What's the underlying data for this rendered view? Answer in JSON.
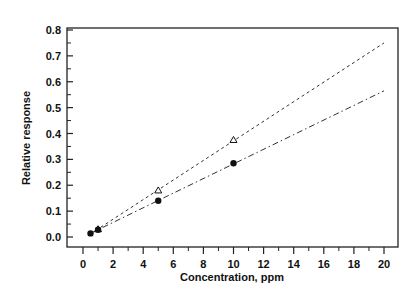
{
  "chart_data": {
    "type": "scatter",
    "title": "",
    "xlabel": "Concentration, ppm",
    "ylabel": "Relative response",
    "xlim": [
      -1,
      21
    ],
    "ylim": [
      -0.03,
      0.8
    ],
    "x_ticks": [
      0,
      2,
      4,
      6,
      8,
      10,
      12,
      14,
      16,
      18,
      20
    ],
    "x_tick_labels": [
      "0",
      "2",
      "4",
      "6",
      "8",
      "10",
      "12",
      "14",
      "16",
      "18",
      "20"
    ],
    "y_ticks": [
      0.0,
      0.1,
      0.2,
      0.3,
      0.4,
      0.5,
      0.6,
      0.7,
      0.8
    ],
    "y_tick_labels": [
      "0.0",
      "0.1",
      "0.2",
      "0.3",
      "0.4",
      "0.5",
      "0.6",
      "0.7",
      "0.8"
    ],
    "grid": false,
    "legend": null,
    "series": [
      {
        "name": "open triangles",
        "marker": "triangle-open",
        "line_style": "dotted",
        "x": [
          1,
          5,
          10
        ],
        "y": [
          0.03,
          0.18,
          0.375
        ],
        "fit_line": {
          "x": [
            0.5,
            20
          ],
          "y": [
            0.012,
            0.75
          ]
        }
      },
      {
        "name": "filled circles",
        "marker": "circle-filled",
        "line_style": "dash-dot",
        "x": [
          0.5,
          1,
          5,
          10
        ],
        "y": [
          0.014,
          0.028,
          0.14,
          0.285
        ],
        "fit_line": {
          "x": [
            0.5,
            20
          ],
          "y": [
            0.014,
            0.565
          ]
        }
      }
    ]
  }
}
